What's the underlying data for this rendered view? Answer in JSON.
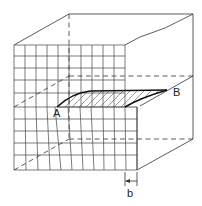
{
  "diagram": {
    "type": "edge-dislocation-crystal-block",
    "labels": {
      "point_a": "A",
      "point_b": "B",
      "burgers_vector": "b"
    },
    "colors": {
      "line": "#333333",
      "background": "#ffffff"
    }
  }
}
